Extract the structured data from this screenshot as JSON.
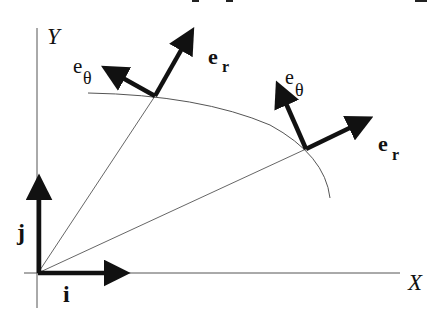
{
  "diagram": {
    "type": "polar unit vectors diagram",
    "axes": {
      "x_label": "X",
      "y_label": "Y"
    },
    "cartesian_unit_vectors": {
      "i_label": "i",
      "j_label": "j"
    },
    "points": [
      {
        "name": "point-1",
        "e_r_label": "e",
        "e_r_sub": "r",
        "e_theta_label": "e",
        "e_theta_sub": "θ"
      },
      {
        "name": "point-2",
        "e_r_label": "e",
        "e_r_sub": "r",
        "e_theta_label": "e",
        "e_theta_sub": "θ"
      }
    ],
    "colors": {
      "vector": "#111111",
      "thin_line": "#555555",
      "background": "#ffffff"
    }
  }
}
